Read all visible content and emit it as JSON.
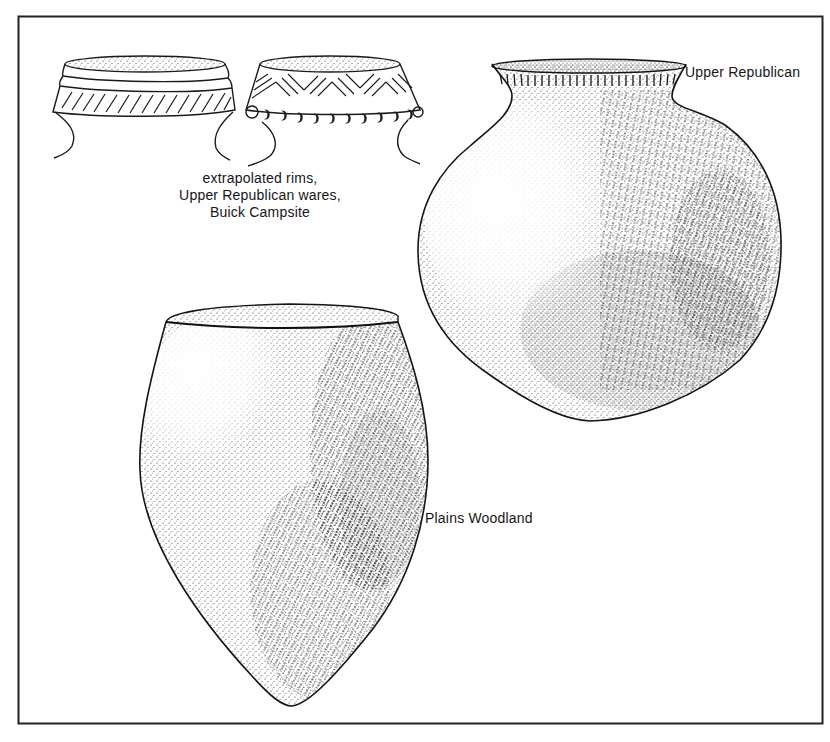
{
  "figure": {
    "caption": {
      "lines": [
        "extrapolated rims,",
        "Upper Republican wares,",
        "Buick Campsite"
      ]
    },
    "labels": {
      "upper_republican": "Upper Republican",
      "plains_woodland": "Plains Woodland"
    },
    "items": [
      {
        "id": "rim-sherd-1",
        "description": "extrapolated rim with banded lip and diagonal hatched collar"
      },
      {
        "id": "rim-sherd-2",
        "description": "extrapolated rim with chevron-incised collar and row of punctate nodes"
      },
      {
        "id": "upper-republican-jar",
        "description": "globular jar with flared, tick-incised rim, cord-roughened stippled body"
      },
      {
        "id": "plains-woodland-vessel",
        "description": "conoidal-bottom jar with cord-roughened stippled body"
      }
    ],
    "colors": {
      "ink": "#111111",
      "paper": "#ffffff",
      "frame": "#222222"
    }
  }
}
